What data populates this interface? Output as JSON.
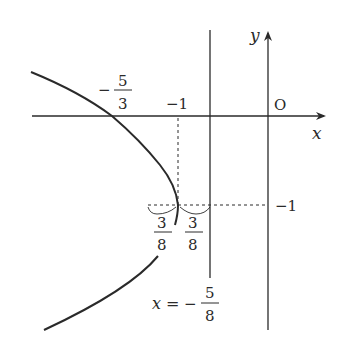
{
  "diagram": {
    "type": "parabola-graph",
    "axes": {
      "x_label": "x",
      "y_label": "y",
      "origin_label": "O"
    },
    "labels": {
      "x_intercept_minus": "−",
      "x_intercept_num": "5",
      "x_intercept_den": "3",
      "x_tick_minus1": "−1",
      "y_tick_minus1": "−1",
      "left_dist_num": "3",
      "left_dist_den": "8",
      "right_dist_num": "3",
      "right_dist_den": "8",
      "directrix_lhs": "x",
      "directrix_eq": "=",
      "directrix_minus": "−",
      "directrix_num": "5",
      "directrix_den": "8"
    },
    "elements": {
      "curve": "parabola opening left, vertex (-1,-1), passing through (-5/3, 0)",
      "directrix": "x = -5/8",
      "vertex": "(-1, -1)",
      "focus_offset": "3/8"
    },
    "colors": {
      "ink": "#2a2a2a",
      "background": "#ffffff"
    }
  }
}
